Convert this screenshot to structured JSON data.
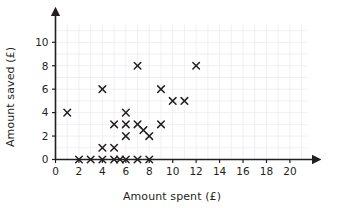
{
  "chart_data": {
    "type": "scatter",
    "title": "",
    "xlabel": "Amount spent (£)",
    "ylabel": "Amount saved (£)",
    "xlim": [
      0,
      21.5
    ],
    "ylim": [
      0,
      11.5
    ],
    "xticks": [
      0,
      2,
      4,
      6,
      8,
      10,
      12,
      14,
      16,
      18,
      20
    ],
    "yticks": [
      0,
      2,
      4,
      6,
      8,
      10
    ],
    "xtick_labels": [
      "0",
      "2",
      "4",
      "6",
      "8",
      "10",
      "12",
      "14",
      "16",
      "18",
      "20"
    ],
    "ytick_labels": [
      "0",
      "2",
      "4",
      "6",
      "8",
      "10"
    ],
    "grid": true,
    "legend": null,
    "marker": "x",
    "marker_color": "#231f20",
    "points": [
      {
        "x": 1,
        "y": 4
      },
      {
        "x": 2,
        "y": 0
      },
      {
        "x": 3,
        "y": 0
      },
      {
        "x": 4,
        "y": 0
      },
      {
        "x": 4,
        "y": 1
      },
      {
        "x": 4,
        "y": 6
      },
      {
        "x": 5,
        "y": 0
      },
      {
        "x": 5,
        "y": 1
      },
      {
        "x": 5,
        "y": 3
      },
      {
        "x": 5.5,
        "y": 0
      },
      {
        "x": 6,
        "y": 0
      },
      {
        "x": 6,
        "y": 2
      },
      {
        "x": 6,
        "y": 3
      },
      {
        "x": 6,
        "y": 4
      },
      {
        "x": 7,
        "y": 0
      },
      {
        "x": 7,
        "y": 3
      },
      {
        "x": 7,
        "y": 8
      },
      {
        "x": 7.5,
        "y": 2.5
      },
      {
        "x": 8,
        "y": 0
      },
      {
        "x": 8,
        "y": 2
      },
      {
        "x": 9,
        "y": 3
      },
      {
        "x": 9,
        "y": 6
      },
      {
        "x": 10,
        "y": 5
      },
      {
        "x": 11,
        "y": 5
      },
      {
        "x": 12,
        "y": 8
      }
    ]
  },
  "axes": {
    "x_title": "Amount spent (£)",
    "y_title": "Amount saved (£)"
  },
  "colors": {
    "marker": "#231f20",
    "axis": "#231f20",
    "grid": "#e9e9ef",
    "background": "#ffffff"
  }
}
